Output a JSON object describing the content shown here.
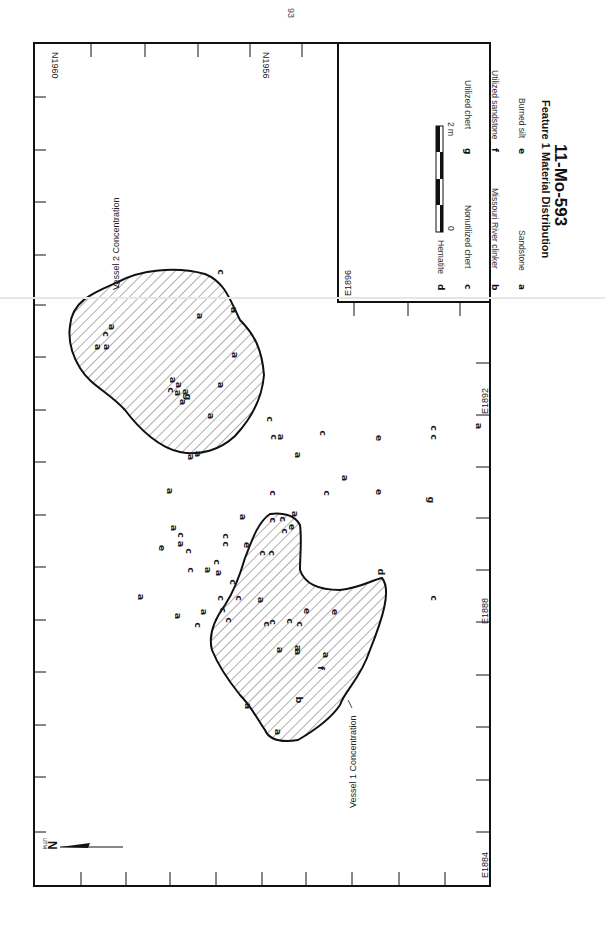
{
  "page": {
    "number": "93"
  },
  "map": {
    "title": "11-Mo-593",
    "subtitle": "Feature 1 Material Distribution",
    "north_label": "N",
    "grid_label": "UTM",
    "scale": {
      "start": "0",
      "end": "2 m"
    },
    "northings": [
      {
        "label": "N1960"
      },
      {
        "label": "N1956"
      }
    ],
    "eastings": [
      {
        "label": "E1884"
      },
      {
        "label": "E1888"
      },
      {
        "label": "E1892"
      },
      {
        "label": "E1896"
      }
    ],
    "concentrations": [
      {
        "label": "Vessel 1 Concentration"
      },
      {
        "label": "Vessel 2 Concentration"
      }
    ],
    "legend": [
      {
        "key": "a",
        "label": "Sandstone"
      },
      {
        "key": "b",
        "label": "Missouri River clinker"
      },
      {
        "key": "c",
        "label": "Nonutilized chert"
      },
      {
        "key": "d",
        "label": "Hematite"
      },
      {
        "key": "e",
        "label": "Burned silt"
      },
      {
        "key": "f",
        "label": "Utilized sandstone"
      },
      {
        "key": "g",
        "label": "Utilized chert"
      }
    ],
    "points": [
      {
        "k": "c",
        "x": 220,
        "y": 272
      },
      {
        "k": "a",
        "x": 233,
        "y": 310
      },
      {
        "k": "a",
        "x": 199,
        "y": 316
      },
      {
        "k": "a",
        "x": 234,
        "y": 355
      },
      {
        "k": "a",
        "x": 220,
        "y": 385
      },
      {
        "k": "a",
        "x": 178,
        "y": 385
      },
      {
        "k": "a",
        "x": 97,
        "y": 347
      },
      {
        "k": "a",
        "x": 106,
        "y": 347
      },
      {
        "k": "c",
        "x": 105,
        "y": 334
      },
      {
        "k": "a",
        "x": 111,
        "y": 327
      },
      {
        "k": "a",
        "x": 172,
        "y": 380
      },
      {
        "k": "c",
        "x": 170,
        "y": 390
      },
      {
        "k": "a",
        "x": 177,
        "y": 393
      },
      {
        "k": "a",
        "x": 185,
        "y": 392
      },
      {
        "k": "g",
        "x": 187,
        "y": 397
      },
      {
        "k": "a",
        "x": 182,
        "y": 402
      },
      {
        "k": "a",
        "x": 210,
        "y": 416
      },
      {
        "k": "a",
        "x": 190,
        "y": 457
      },
      {
        "k": "a",
        "x": 197,
        "y": 454
      },
      {
        "k": "c",
        "x": 269,
        "y": 419
      },
      {
        "k": "c",
        "x": 273,
        "y": 437
      },
      {
        "k": "a",
        "x": 280,
        "y": 437
      },
      {
        "k": "a",
        "x": 297,
        "y": 455
      },
      {
        "k": "a",
        "x": 169,
        "y": 491
      },
      {
        "k": "c",
        "x": 272,
        "y": 493
      },
      {
        "k": "c",
        "x": 322,
        "y": 433
      },
      {
        "k": "a",
        "x": 242,
        "y": 517
      },
      {
        "k": "a",
        "x": 173,
        "y": 528
      },
      {
        "k": "c",
        "x": 180,
        "y": 535
      },
      {
        "k": "a",
        "x": 180,
        "y": 544
      },
      {
        "k": "e",
        "x": 161,
        "y": 548
      },
      {
        "k": "c",
        "x": 188,
        "y": 551
      },
      {
        "k": "c",
        "x": 225,
        "y": 536
      },
      {
        "k": "c",
        "x": 225,
        "y": 544
      },
      {
        "k": "a",
        "x": 140,
        "y": 597
      },
      {
        "k": "c",
        "x": 190,
        "y": 570
      },
      {
        "k": "a",
        "x": 207,
        "y": 570
      },
      {
        "k": "c",
        "x": 216,
        "y": 562
      },
      {
        "k": "a",
        "x": 218,
        "y": 573
      },
      {
        "k": "c",
        "x": 232,
        "y": 582
      },
      {
        "k": "a",
        "x": 177,
        "y": 616
      },
      {
        "k": "a",
        "x": 203,
        "y": 612
      },
      {
        "k": "c",
        "x": 197,
        "y": 625
      },
      {
        "k": "c",
        "x": 220,
        "y": 598
      },
      {
        "k": "c",
        "x": 222,
        "y": 610
      },
      {
        "k": "c",
        "x": 228,
        "y": 620
      },
      {
        "k": "c",
        "x": 238,
        "y": 598
      },
      {
        "k": "a",
        "x": 260,
        "y": 600
      },
      {
        "k": "c",
        "x": 272,
        "y": 622
      },
      {
        "k": "e",
        "x": 246,
        "y": 545
      },
      {
        "k": "c",
        "x": 262,
        "y": 553
      },
      {
        "k": "c",
        "x": 271,
        "y": 553
      },
      {
        "k": "c",
        "x": 284,
        "y": 531
      },
      {
        "k": "e",
        "x": 291,
        "y": 527
      },
      {
        "k": "c",
        "x": 272,
        "y": 520
      },
      {
        "k": "c",
        "x": 282,
        "y": 519
      },
      {
        "k": "a",
        "x": 294,
        "y": 514
      },
      {
        "k": "c",
        "x": 266,
        "y": 624
      },
      {
        "k": "c",
        "x": 289,
        "y": 621
      },
      {
        "k": "e",
        "x": 306,
        "y": 611
      },
      {
        "k": "e",
        "x": 334,
        "y": 612
      },
      {
        "k": "a",
        "x": 279,
        "y": 650
      },
      {
        "k": "a",
        "x": 297,
        "y": 648
      },
      {
        "k": "a",
        "x": 297,
        "y": 652
      },
      {
        "k": "c",
        "x": 299,
        "y": 624
      },
      {
        "k": "a",
        "x": 325,
        "y": 655
      },
      {
        "k": "f",
        "x": 320,
        "y": 668
      },
      {
        "k": "b",
        "x": 298,
        "y": 700
      },
      {
        "k": "a",
        "x": 247,
        "y": 706
      },
      {
        "k": "a",
        "x": 277,
        "y": 732
      },
      {
        "k": "d",
        "x": 380,
        "y": 572
      },
      {
        "k": "e",
        "x": 378,
        "y": 438
      },
      {
        "k": "e",
        "x": 378,
        "y": 492
      },
      {
        "k": "c",
        "x": 433,
        "y": 428
      },
      {
        "k": "c",
        "x": 433,
        "y": 437
      },
      {
        "k": "a",
        "x": 478,
        "y": 426
      },
      {
        "k": "g",
        "x": 430,
        "y": 500
      },
      {
        "k": "c",
        "x": 433,
        "y": 598
      },
      {
        "k": "a",
        "x": 344,
        "y": 478
      },
      {
        "k": "c",
        "x": 326,
        "y": 493
      }
    ]
  },
  "colors": {
    "ink": "#111111",
    "paper": "#ffffff",
    "hatch": "#333333"
  }
}
